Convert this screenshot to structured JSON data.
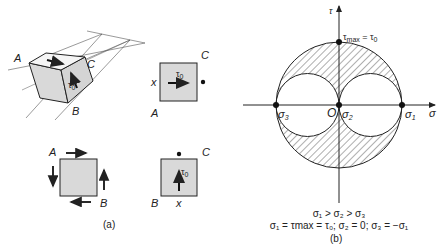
{
  "panel_a": {
    "caption": "(a)",
    "cube": {
      "label_A": "A",
      "label_B": "B",
      "label_C": "C",
      "stress": "τ",
      "stress_sub": "0"
    },
    "element_top_right": {
      "label_x": "x",
      "label_A": "A",
      "label_C": "C",
      "stress": "τ",
      "stress_sub": "0"
    },
    "element_bottom_left": {
      "label_A": "A",
      "label_B": "B"
    },
    "element_bottom_right": {
      "label_B": "B",
      "label_x": "x",
      "label_C": "C",
      "stress": "τ",
      "stress_sub": "0"
    }
  },
  "panel_b": {
    "caption": "(b)",
    "axis_tau": "τ",
    "axis_sigma": "σ",
    "origin": "O",
    "top_point": {
      "label": "τ",
      "sub": "max",
      "eq": " = τ",
      "eq_sub": "0"
    },
    "points": [
      {
        "label": "σ",
        "sub": "3"
      },
      {
        "label": "σ",
        "sub": "2"
      },
      {
        "label": "σ",
        "sub": "1"
      }
    ],
    "condition_line": "σ₁ > σ₂ > σ₃",
    "relation_line": "σ₁ = τmax = τ₀; σ₂ = 0; σ₃ = −σ₁",
    "colors": {
      "ink": "#222222",
      "fill": "#d9d9d9",
      "hatch": "#333333"
    }
  }
}
